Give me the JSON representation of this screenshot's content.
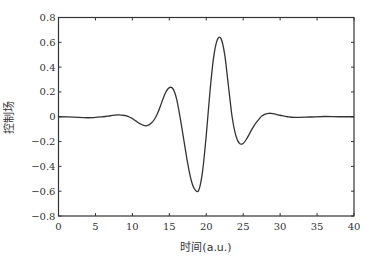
{
  "chart_data": {
    "type": "line",
    "title": "",
    "xlabel": "时间(a.u.)",
    "ylabel": "控制场",
    "xlim": [
      0,
      40
    ],
    "ylim": [
      -0.8,
      0.8
    ],
    "xticks": [
      0,
      5,
      10,
      15,
      20,
      25,
      30,
      35,
      40
    ],
    "xtick_labels": [
      "0",
      "5",
      "10",
      "15",
      "20",
      "25",
      "30",
      "35",
      "40"
    ],
    "yticks": [
      0.8,
      0.6,
      0.4,
      0.2,
      0,
      -0.2,
      -0.4,
      -0.6,
      -0.8
    ],
    "ytick_labels": [
      "0.8",
      "0.6",
      "0.4",
      "0.2",
      "0",
      "−0.2",
      "−0.4",
      "−0.6",
      "−0.8"
    ],
    "grid": false,
    "legend": null,
    "series": [
      {
        "name": "控制场",
        "color": "#333333",
        "x": [
          0,
          2,
          4,
          6,
          7,
          8,
          9,
          9.5,
          10,
          10.5,
          11,
          11.5,
          12,
          12.5,
          13,
          13.5,
          14,
          14.5,
          15,
          15.5,
          16,
          16.5,
          17,
          17.5,
          18,
          18.5,
          19,
          19.5,
          20,
          20.5,
          21,
          21.5,
          22,
          22.5,
          23,
          23.5,
          24,
          24.5,
          25,
          25.5,
          26,
          26.5,
          27,
          27.5,
          28,
          28.5,
          29,
          30,
          31,
          32,
          34,
          36,
          38,
          40
        ],
        "y": [
          0.0,
          -0.003,
          -0.008,
          0.0,
          0.008,
          0.015,
          0.01,
          0.0,
          -0.015,
          -0.035,
          -0.055,
          -0.07,
          -0.072,
          -0.055,
          -0.02,
          0.04,
          0.12,
          0.195,
          0.235,
          0.225,
          0.14,
          -0.02,
          -0.2,
          -0.38,
          -0.52,
          -0.59,
          -0.59,
          -0.44,
          -0.15,
          0.2,
          0.48,
          0.62,
          0.63,
          0.5,
          0.25,
          0.0,
          -0.15,
          -0.215,
          -0.215,
          -0.175,
          -0.12,
          -0.07,
          -0.03,
          0.005,
          0.022,
          0.028,
          0.025,
          0.012,
          0.0,
          -0.005,
          -0.002,
          0.002,
          0.0,
          0.0
        ]
      }
    ]
  }
}
